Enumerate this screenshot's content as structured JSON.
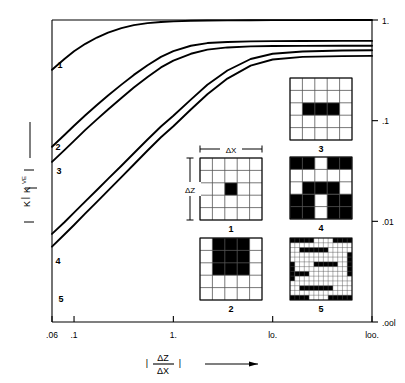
{
  "chart_data": {
    "type": "line",
    "title": "",
    "xlabel": "|ΔZ/ΔX|",
    "ylabel": "K_VE/K",
    "xscale": "log",
    "yscale": "log",
    "xlim": [
      0.06,
      100.0
    ],
    "ylim": [
      0.001,
      1.0
    ],
    "grid": false,
    "legend_position": "inline-curve-labels",
    "x_ticks": [
      {
        "value": 0.06,
        "label": ".06"
      },
      {
        "value": 0.1,
        "label": ".1"
      },
      {
        "value": 1.0,
        "label": "1."
      },
      {
        "value": 10.0,
        "label": "lo."
      },
      {
        "value": 100.0,
        "label": "loo."
      }
    ],
    "y_ticks": [
      {
        "value": 1.0,
        "label": "1."
      },
      {
        "value": 0.1,
        "label": ".1"
      },
      {
        "value": 0.01,
        "label": ".01"
      },
      {
        "value": 0.001,
        "label": ".ool"
      }
    ],
    "series": [
      {
        "name": "1",
        "label": "1",
        "plateau": 1.0,
        "x": [
          0.06,
          0.08,
          0.1,
          0.13,
          0.17,
          0.22,
          0.3,
          0.4,
          0.55,
          0.75,
          1.0,
          1.5,
          2.2,
          3.5,
          6.0,
          10.0,
          20.0,
          50.0,
          100.0
        ],
        "y": [
          0.32,
          0.41,
          0.49,
          0.58,
          0.67,
          0.75,
          0.83,
          0.89,
          0.93,
          0.955,
          0.97,
          0.982,
          0.988,
          0.992,
          0.995,
          0.997,
          0.998,
          0.999,
          1.0
        ]
      },
      {
        "name": "2",
        "label": "2",
        "plateau": 0.62,
        "x": [
          0.06,
          0.08,
          0.1,
          0.13,
          0.17,
          0.22,
          0.3,
          0.4,
          0.55,
          0.75,
          1.0,
          1.5,
          2.2,
          3.5,
          6.0,
          10.0,
          20.0,
          50.0,
          100.0
        ],
        "y": [
          0.055,
          0.072,
          0.089,
          0.113,
          0.143,
          0.178,
          0.228,
          0.285,
          0.355,
          0.43,
          0.49,
          0.555,
          0.59,
          0.605,
          0.613,
          0.617,
          0.619,
          0.62,
          0.62
        ]
      },
      {
        "name": "3",
        "label": "3",
        "plateau": 0.555,
        "x": [
          0.06,
          0.08,
          0.1,
          0.13,
          0.17,
          0.22,
          0.3,
          0.4,
          0.55,
          0.75,
          1.0,
          1.5,
          2.2,
          3.5,
          6.0,
          10.0,
          20.0,
          50.0,
          100.0
        ],
        "y": [
          0.039,
          0.051,
          0.063,
          0.081,
          0.103,
          0.129,
          0.168,
          0.214,
          0.272,
          0.338,
          0.395,
          0.462,
          0.508,
          0.534,
          0.547,
          0.551,
          0.553,
          0.555,
          0.555
        ]
      },
      {
        "name": "4",
        "label": "4",
        "plateau": 0.5,
        "x": [
          0.06,
          0.08,
          0.1,
          0.13,
          0.17,
          0.22,
          0.3,
          0.4,
          0.55,
          0.75,
          1.0,
          1.5,
          2.2,
          3.5,
          6.0,
          10.0,
          20.0,
          50.0,
          100.0
        ],
        "y": [
          0.0075,
          0.0098,
          0.0122,
          0.0158,
          0.0205,
          0.0264,
          0.0357,
          0.0475,
          0.065,
          0.0875,
          0.112,
          0.162,
          0.227,
          0.315,
          0.41,
          0.462,
          0.487,
          0.497,
          0.5
        ]
      },
      {
        "name": "5",
        "label": "5",
        "plateau": 0.44,
        "x": [
          0.06,
          0.08,
          0.1,
          0.13,
          0.17,
          0.22,
          0.3,
          0.4,
          0.55,
          0.75,
          1.0,
          1.5,
          2.2,
          3.5,
          6.0,
          10.0,
          20.0,
          50.0,
          100.0
        ],
        "y": [
          0.0056,
          0.0074,
          0.0092,
          0.012,
          0.0156,
          0.0202,
          0.0275,
          0.0367,
          0.0505,
          0.0685,
          0.088,
          0.129,
          0.183,
          0.262,
          0.352,
          0.405,
          0.43,
          0.438,
          0.44
        ]
      }
    ]
  },
  "axes": {
    "x_axis_label_numerator": "ΔZ",
    "x_axis_label_denominator": "ΔX",
    "x_axis_bar_left": "|",
    "x_axis_bar_right": "|",
    "y_axis_label_numerator": "K",
    "y_axis_label_numerator_sub": "VE",
    "y_axis_label_denominator": "K",
    "y_axis_label_bar_top": "|",
    "y_axis_label_bar_bottom": "|"
  },
  "insets": {
    "dim_x_label": "ΔX",
    "dim_z_label": "ΔZ",
    "items": [
      {
        "id": "1",
        "label": "1",
        "grid_cols": 5,
        "grid_rows": 5,
        "fine": false,
        "blocks": [
          {
            "c": 2,
            "r": 2,
            "w": 1,
            "h": 1
          }
        ]
      },
      {
        "id": "2",
        "label": "2",
        "grid_cols": 5,
        "grid_rows": 5,
        "fine": false,
        "blocks": [
          {
            "c": 1,
            "r": 0,
            "w": 3,
            "h": 3
          }
        ]
      },
      {
        "id": "3",
        "label": "3",
        "grid_cols": 5,
        "grid_rows": 5,
        "fine": false,
        "blocks": [
          {
            "c": 1,
            "r": 2,
            "w": 3,
            "h": 1
          }
        ]
      },
      {
        "id": "4",
        "label": "4",
        "grid_cols": 5,
        "grid_rows": 5,
        "fine": false,
        "blocks": [
          {
            "c": 0,
            "r": 0,
            "w": 2,
            "h": 1
          },
          {
            "c": 3,
            "r": 0,
            "w": 2,
            "h": 1
          },
          {
            "c": 1,
            "r": 2,
            "w": 3,
            "h": 1
          },
          {
            "c": 0,
            "r": 3,
            "w": 2,
            "h": 2
          },
          {
            "c": 3,
            "r": 3,
            "w": 2,
            "h": 2
          }
        ]
      },
      {
        "id": "5",
        "label": "5",
        "grid_cols": 13,
        "grid_rows": 13,
        "fine": true,
        "blocks": [
          {
            "c": 0,
            "r": 0,
            "w": 5,
            "h": 1
          },
          {
            "c": 9,
            "r": 0,
            "w": 4,
            "h": 1
          },
          {
            "c": 2,
            "r": 2,
            "w": 6,
            "h": 1
          },
          {
            "c": 0,
            "r": 5,
            "w": 1,
            "h": 4
          },
          {
            "c": 5,
            "r": 5,
            "w": 5,
            "h": 1
          },
          {
            "c": 12,
            "r": 3,
            "w": 1,
            "h": 5
          },
          {
            "c": 1,
            "r": 7,
            "w": 3,
            "h": 1
          },
          {
            "c": 2,
            "r": 10,
            "w": 7,
            "h": 1
          },
          {
            "c": 0,
            "r": 12,
            "w": 4,
            "h": 1
          },
          {
            "c": 8,
            "r": 12,
            "w": 5,
            "h": 1
          }
        ]
      }
    ]
  }
}
